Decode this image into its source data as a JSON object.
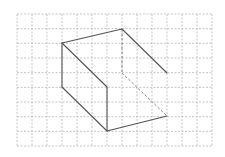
{
  "figure": {
    "type": "isometric-solid-on-grid",
    "background": "#ffffff",
    "grid": {
      "x0": 17,
      "y0": 14,
      "cols": 13,
      "rows": 9,
      "cell_w": 15,
      "cell_h": 14.67,
      "color": "#b8b8b8",
      "dash": "2,1.5"
    },
    "edge_color": "#555555",
    "hidden_edge_color": "#777777",
    "vertices": {
      "A": [
        62,
        43
      ],
      "B": [
        122,
        29
      ],
      "C": [
        167,
        73
      ],
      "D": [
        62,
        87
      ],
      "F": [
        107,
        87
      ],
      "E": [
        107,
        131
      ],
      "G": [
        167,
        116
      ],
      "H": [
        122,
        73
      ]
    },
    "solid_edges": [
      [
        "A",
        "B"
      ],
      [
        "B",
        "C"
      ],
      [
        "A",
        "F"
      ],
      [
        "A",
        "D"
      ],
      [
        "D",
        "E"
      ],
      [
        "F",
        "E"
      ],
      [
        "E",
        "G"
      ]
    ],
    "hidden_edges": [
      [
        "B",
        "H"
      ],
      [
        "H",
        "G"
      ]
    ]
  }
}
